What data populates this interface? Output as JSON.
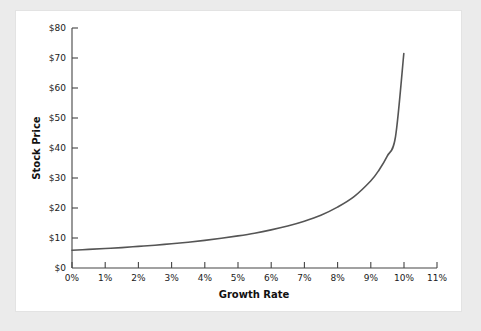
{
  "figure": {
    "background_color": "#ebebeb",
    "panel_color": "#ffffff",
    "panel_border_color": "#e3e3e3"
  },
  "chart_data": {
    "type": "line",
    "title": "",
    "subtitle": "",
    "xlabel": "Growth Rate",
    "ylabel": "Stock Price",
    "xlim": [
      0,
      11
    ],
    "ylim": [
      0,
      80
    ],
    "grid": false,
    "legend": "none",
    "line_color": "#555555",
    "axis_color": "#444444",
    "x_tick_labels": [
      "0%",
      "1%",
      "2%",
      "3%",
      "4%",
      "5%",
      "6%",
      "7%",
      "8%",
      "9%",
      "10%",
      "11%"
    ],
    "x_tick_values": [
      0,
      1,
      2,
      3,
      4,
      5,
      6,
      7,
      8,
      9,
      10,
      11
    ],
    "y_tick_labels": [
      "$0",
      "$10",
      "$20",
      "$30",
      "$40",
      "$50",
      "$60",
      "$70",
      "$80"
    ],
    "y_tick_values": [
      0,
      10,
      20,
      30,
      40,
      50,
      60,
      70,
      80
    ],
    "series": [
      {
        "name": "Stock Price vs Growth Rate",
        "x": [
          0,
          0.5,
          1,
          1.5,
          2,
          2.5,
          3,
          3.5,
          4,
          4.5,
          5,
          5.5,
          6,
          6.5,
          7,
          7.5,
          8,
          8.5,
          9,
          9.25,
          9.5,
          9.75,
          10
        ],
        "values": [
          5.9,
          6.2,
          6.5,
          6.8,
          7.2,
          7.6,
          8.1,
          8.6,
          9.2,
          9.9,
          10.7,
          11.6,
          12.7,
          14.0,
          15.6,
          17.6,
          20.3,
          23.8,
          29.0,
          32.6,
          37.3,
          43.8,
          71.5
        ]
      }
    ]
  }
}
